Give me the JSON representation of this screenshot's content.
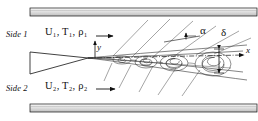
{
  "figure": {
    "background_color": "#ffffff",
    "line_color": "#111111",
    "wall_fill_color": "#dddddd"
  },
  "labels": {
    "side1": "Side 1",
    "side2": "Side 2",
    "stream1": {
      "velocity": "U",
      "temperature": "T",
      "density": "ρ",
      "subscript": "1",
      "full": "U₁, T₁, ρ₁"
    },
    "stream2": {
      "velocity": "U",
      "temperature": "T",
      "density": "ρ",
      "subscript": "2",
      "full": "U₂, T₂, ρ₂"
    },
    "axis_x": "x",
    "axis_y": "y",
    "spreading_angle": "α",
    "layer_thickness": "δ"
  },
  "geometry": {
    "top_wall": {
      "x": 30,
      "y": 8,
      "width": 227,
      "height": 8
    },
    "bottom_wall": {
      "x": 30,
      "y": 104,
      "width": 227,
      "height": 8
    },
    "splitter_tip_x": 88,
    "splitter_tip_y": 58,
    "origin": {
      "x": 88,
      "y": 58
    },
    "delta_marker_x": 219,
    "delta_top_y": 49,
    "delta_bottom_y": 73,
    "alpha_vertex": {
      "x": 186,
      "y": 36
    }
  },
  "vortices": [
    {
      "cx": 122,
      "cy": 60,
      "rx": 9,
      "ry": 4
    },
    {
      "cx": 146,
      "cy": 62,
      "rx": 11,
      "ry": 6
    },
    {
      "cx": 174,
      "cy": 63,
      "rx": 14,
      "ry": 8
    },
    {
      "cx": 213,
      "cy": 64,
      "rx": 18,
      "ry": 12
    }
  ],
  "mach_waves_upper": 5,
  "mach_waves_lower": 5
}
